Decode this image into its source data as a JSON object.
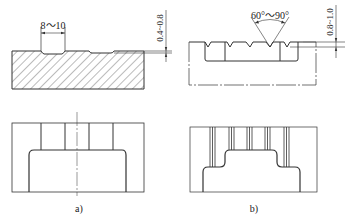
{
  "figure": {
    "panel_a": {
      "label": "a)",
      "groove_width_dim": "8～10",
      "groove_depth_dim": "0.4~0.8",
      "description": "Flat-bottom grooves with section hatching and plan view"
    },
    "panel_b": {
      "label": "b)",
      "groove_angle_dim": "60°～90°",
      "groove_depth_dim": "0.8~1.0",
      "description": "V-grooves cross-section and plan view with multiple groove lines"
    },
    "colors": {
      "line": "#333333",
      "background": "#ffffff",
      "hatch": "#555555"
    }
  }
}
